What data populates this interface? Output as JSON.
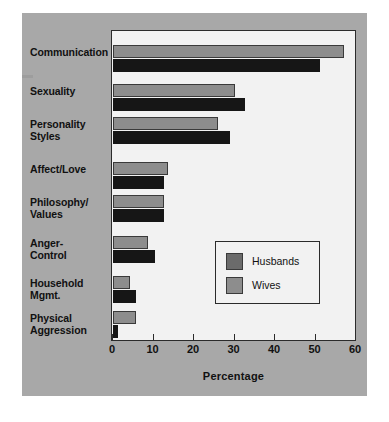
{
  "figure": {
    "background_color": "#a8a8a8",
    "plot_background_color": "#f2f2f2"
  },
  "legend": {
    "position": "inside-center-right",
    "entries": [
      {
        "label": "Husbands",
        "color": "#6b6b6b",
        "swatch_name": "husbands-swatch"
      },
      {
        "label": "Wives",
        "color": "#8d8d8d",
        "swatch_name": "wives-swatch"
      }
    ]
  },
  "chart_data": {
    "type": "bar",
    "orientation": "horizontal",
    "title": "",
    "xlabel": "Percentage",
    "ylabel": "",
    "xlim": [
      0,
      60
    ],
    "xticks": [
      0,
      10,
      20,
      30,
      40,
      50,
      60
    ],
    "xtick_labels": [
      "0",
      "10",
      "20",
      "30",
      "40",
      "50",
      "60"
    ],
    "grid": false,
    "categories": [
      "Communication",
      "Sexuality",
      "Personality Styles",
      "Affect/Love",
      "Philosophy/Values",
      "Anger-Control",
      "Household Mgmt.",
      "Physical Aggression"
    ],
    "category_label_lines": [
      [
        "Communication"
      ],
      [
        "Sexuality"
      ],
      [
        "Personality",
        "Styles"
      ],
      [
        "Affect/Love"
      ],
      [
        "Philosophy/",
        "Values"
      ],
      [
        "Anger-",
        "Control"
      ],
      [
        "Household",
        "Mgmt."
      ],
      [
        "Physical",
        "Aggression"
      ]
    ],
    "series": [
      {
        "name": "Wives",
        "color": "#8d8d8d",
        "values": [
          57,
          30,
          26,
          13.5,
          12.5,
          8.7,
          4.2,
          5.7
        ]
      },
      {
        "name": "Husbands",
        "color": "#5f5f5f",
        "values": [
          51,
          32.5,
          29,
          12.5,
          12.5,
          10.4,
          5.6,
          1.3
        ]
      }
    ]
  }
}
